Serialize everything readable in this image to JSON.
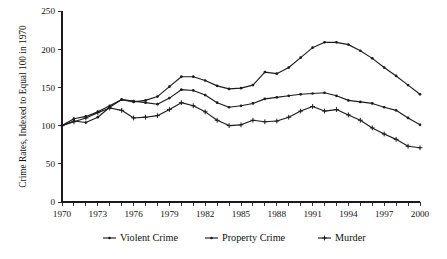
{
  "chart_data": {
    "type": "line",
    "title": "",
    "xlabel": "",
    "ylabel": "Crime Rates, Indexed to Equal 100 in 1970",
    "xlim": [
      1970,
      2000
    ],
    "ylim": [
      0,
      250
    ],
    "grid": false,
    "legend_position": "bottom",
    "y_ticks": [
      0,
      50,
      100,
      150,
      200,
      250
    ],
    "y_tick_labels": [
      "0",
      "50",
      "100",
      "150",
      "200",
      "250"
    ],
    "x_ticks": [
      1970,
      1971,
      1972,
      1973,
      1974,
      1975,
      1976,
      1977,
      1978,
      1979,
      1980,
      1981,
      1982,
      1983,
      1984,
      1985,
      1986,
      1987,
      1988,
      1989,
      1990,
      1991,
      1992,
      1993,
      1994,
      1995,
      1996,
      1997,
      1998,
      1999,
      2000
    ],
    "x_tick_labels_shown": [
      "1970",
      "1973",
      "1976",
      "1979",
      "1982",
      "1985",
      "1988",
      "1991",
      "1994",
      "1997",
      "2000"
    ],
    "x_tick_label_years": [
      1970,
      1973,
      1976,
      1979,
      1982,
      1985,
      1988,
      1991,
      1994,
      1997,
      2000
    ],
    "x": [
      1970,
      1971,
      1972,
      1973,
      1974,
      1975,
      1976,
      1977,
      1978,
      1979,
      1980,
      1981,
      1982,
      1983,
      1984,
      1985,
      1986,
      1987,
      1988,
      1989,
      1990,
      1991,
      1992,
      1993,
      1994,
      1995,
      1996,
      1997,
      1998,
      1999,
      2000
    ],
    "series": [
      {
        "name": "Violent Crime",
        "marker": "dot",
        "color": "#1c1c1c",
        "values": [
          100,
          109,
          112,
          118,
          126,
          134,
          131,
          133,
          138,
          151,
          164,
          164,
          159,
          152,
          148,
          149,
          153,
          170,
          168,
          176,
          189,
          202,
          209,
          209,
          206,
          198,
          188,
          176,
          165,
          153,
          141
        ]
      },
      {
        "name": "Property Crime",
        "marker": "dot",
        "color": "#1c1c1c",
        "values": [
          100,
          106,
          104,
          111,
          124,
          134,
          132,
          130,
          128,
          136,
          147,
          146,
          140,
          130,
          124,
          126,
          129,
          135,
          137,
          139,
          141,
          142,
          143,
          139,
          133,
          131,
          129,
          124,
          120,
          110,
          101
        ]
      },
      {
        "name": "Murder",
        "marker": "plus",
        "color": "#1c1c1c",
        "values": [
          100,
          105,
          110,
          117,
          123,
          120,
          110,
          111,
          113,
          121,
          130,
          126,
          118,
          107,
          100,
          101,
          107,
          105,
          106,
          111,
          119,
          125,
          119,
          121,
          114,
          107,
          97,
          89,
          82,
          73,
          71
        ]
      }
    ]
  },
  "legend": {
    "items": [
      {
        "label": "Violent Crime"
      },
      {
        "label": "Property Crime"
      },
      {
        "label": "Murder"
      }
    ]
  }
}
